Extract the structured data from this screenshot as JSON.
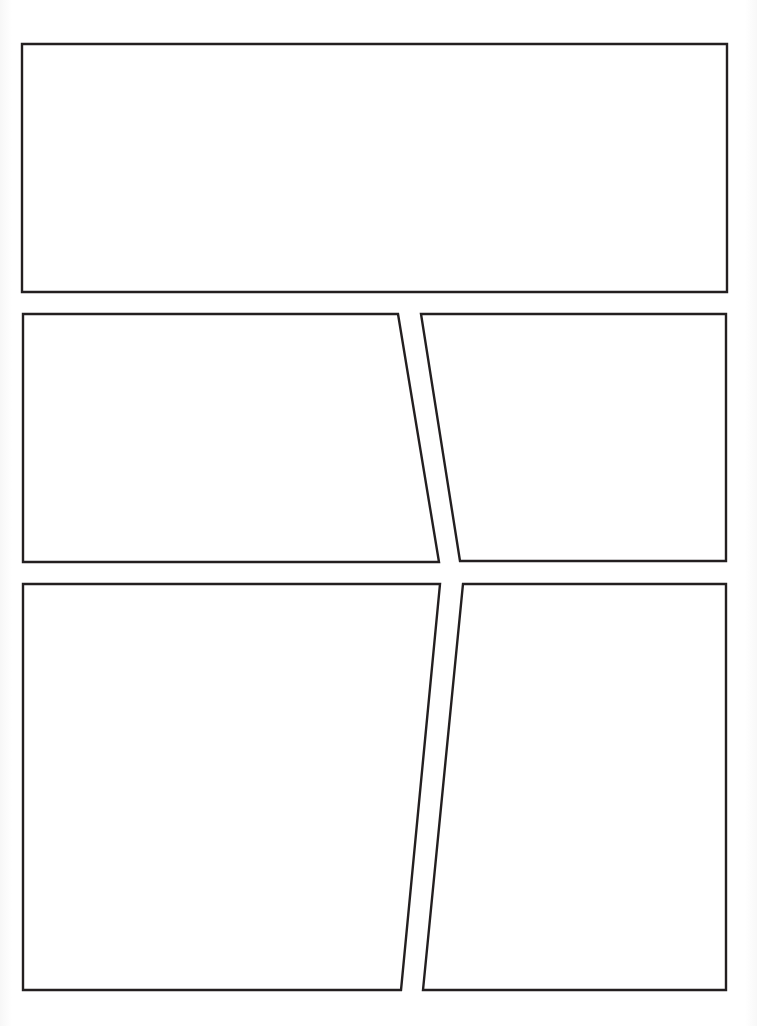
{
  "page": {
    "type": "comic-panel-template",
    "background_color": "#ffffff",
    "border_color": "#231f20",
    "panel_count": 5
  },
  "panels": [
    {
      "id": 1,
      "label": "",
      "points": "22,44 727,44 727,292 22,292"
    },
    {
      "id": 2,
      "label": "",
      "points": "23,314 398,314 439,562 23,562"
    },
    {
      "id": 3,
      "label": "",
      "points": "421,314 726,314 726,561 460,561"
    },
    {
      "id": 4,
      "label": "",
      "points": "23,584 440,584 401,990 23,990"
    },
    {
      "id": 5,
      "label": "",
      "points": "463,584 726,584 726,990 423,990"
    }
  ]
}
